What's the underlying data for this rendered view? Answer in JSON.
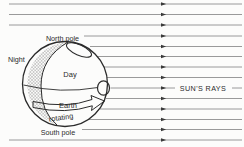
{
  "diagram": {
    "labels": {
      "north_pole": "North pole",
      "south_pole": "South pole",
      "night": "Night",
      "day": "Day",
      "earth": "Earth",
      "rotating": "rotating",
      "suns_rays": "SUN'S RAYS"
    },
    "colors": {
      "background": "#fcfcfb",
      "line": "#2b2b2b",
      "ray": "#8f8f8f",
      "arrowhead": "#3a3a3a",
      "hatch": "#9a9a9a"
    },
    "rays": {
      "count": 14,
      "arrow_x": 161,
      "x_end": 242,
      "lines": [
        {
          "y": 4,
          "x1": 9
        },
        {
          "y": 14.5,
          "x1": 9
        },
        {
          "y": 25,
          "x1": 9
        },
        {
          "y": 36,
          "x1": 84
        },
        {
          "y": 46.5,
          "x1": 90
        },
        {
          "y": 56.5,
          "x1": 97
        },
        {
          "y": 67,
          "x1": 104
        },
        {
          "y": 77.5,
          "x1": 107
        },
        {
          "y": 88,
          "x1": 110.5
        },
        {
          "y": 98.5,
          "x1": 106
        },
        {
          "y": 109,
          "x1": 100
        },
        {
          "y": 119.5,
          "x1": 89
        },
        {
          "y": 129.5,
          "x1": 82
        },
        {
          "y": 140,
          "x1": 9
        }
      ]
    }
  }
}
